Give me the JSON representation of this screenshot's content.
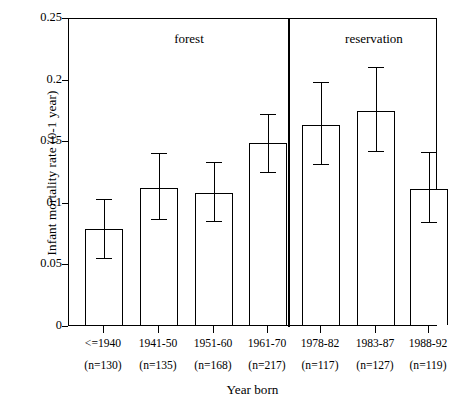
{
  "chart_data": {
    "type": "bar",
    "title": "",
    "xlabel": "Year born",
    "ylabel": "Infant mortality rate (0-1 year)",
    "ylim": [
      0,
      0.25
    ],
    "yticks": [
      "0",
      "0.05",
      "0.1",
      "0.15",
      "0.2",
      "0.25"
    ],
    "ytick_values": [
      0,
      0.05,
      0.1,
      0.15,
      0.2,
      0.25
    ],
    "grid": false,
    "legend": "none",
    "error_bars": "95% confidence interval",
    "group_labels": [
      {
        "name": "forest",
        "categories": [
          "<=1940",
          "1941-50",
          "1951-60",
          "1961-70"
        ]
      },
      {
        "name": "reservation",
        "categories": [
          "1978-82",
          "1983-87",
          "1988-92"
        ]
      }
    ],
    "categories": [
      "<=1940",
      "1941-50",
      "1951-60",
      "1961-70",
      "1978-82",
      "1983-87",
      "1988-92"
    ],
    "sample_labels": [
      "(n=130)",
      "(n=135)",
      "(n=168)",
      "(n=217)",
      "(n=117)",
      "(n=127)",
      "(n=119)"
    ],
    "sample_sizes": [
      130,
      135,
      168,
      217,
      117,
      127,
      119
    ],
    "values": [
      0.078,
      0.111,
      0.107,
      0.148,
      0.162,
      0.174,
      0.11
    ],
    "err_low": [
      0.056,
      0.088,
      0.086,
      0.126,
      0.132,
      0.143,
      0.085
    ],
    "err_high": [
      0.104,
      0.141,
      0.134,
      0.173,
      0.199,
      0.211,
      0.142
    ],
    "colors": {
      "bar_fill": "#ffffff",
      "bar_stroke": "#000000",
      "axis": "#000000",
      "background": "#ffffff"
    }
  }
}
